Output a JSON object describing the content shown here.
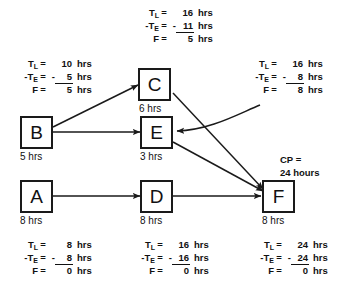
{
  "diagram": {
    "nodes": [
      {
        "id": "C",
        "label": "C",
        "duration": "6 hrs"
      },
      {
        "id": "B",
        "label": "B",
        "duration": "5 hrs"
      },
      {
        "id": "E",
        "label": "E",
        "duration": "3 hrs"
      },
      {
        "id": "A",
        "label": "A",
        "duration": "8 hrs"
      },
      {
        "id": "D",
        "label": "D",
        "duration": "8 hrs"
      },
      {
        "id": "F",
        "label": "F",
        "duration": "8 hrs"
      }
    ],
    "edges": [
      {
        "from": "B",
        "to": "C"
      },
      {
        "from": "B",
        "to": "E"
      },
      {
        "from": "C",
        "to": "F"
      },
      {
        "from": "E",
        "to": "F"
      },
      {
        "from": "A",
        "to": "D"
      },
      {
        "from": "D",
        "to": "F"
      }
    ],
    "calc_blocks": [
      {
        "id": "calc-c",
        "for_node": "C",
        "tl_label": "T",
        "tl_sub": "L",
        "tl_eq": "=",
        "tl_value": "16",
        "tl_unit": "hrs",
        "te_label": "-T",
        "te_sub": "E",
        "te_eq": "=",
        "te_sign": "-",
        "te_value": "11",
        "te_unit": "hrs",
        "f_label": "F",
        "f_eq": "=",
        "f_value": "5",
        "f_unit": "hrs"
      },
      {
        "id": "calc-b",
        "for_node": "B",
        "tl_label": "T",
        "tl_sub": "L",
        "tl_eq": "=",
        "tl_value": "10",
        "tl_unit": "hrs",
        "te_label": "-T",
        "te_sub": "E",
        "te_eq": "=",
        "te_sign": "-",
        "te_value": "5",
        "te_unit": "hrs",
        "f_label": "F",
        "f_eq": "=",
        "f_value": "5",
        "f_unit": "hrs"
      },
      {
        "id": "calc-e",
        "for_node": "E",
        "tl_label": "T",
        "tl_sub": "L",
        "tl_eq": "=",
        "tl_value": "16",
        "tl_unit": "hrs",
        "te_label": "-T",
        "te_sub": "E",
        "te_eq": "=",
        "te_sign": "-",
        "te_value": "8",
        "te_unit": "hrs",
        "f_label": "F",
        "f_eq": "=",
        "f_value": "8",
        "f_unit": "hrs"
      },
      {
        "id": "calc-a",
        "for_node": "A",
        "tl_label": "T",
        "tl_sub": "L",
        "tl_eq": "=",
        "tl_value": "8",
        "tl_unit": "hrs",
        "te_label": "-T",
        "te_sub": "E",
        "te_eq": "=",
        "te_sign": "-",
        "te_value": "8",
        "te_unit": "hrs",
        "f_label": "F",
        "f_eq": "=",
        "f_value": "0",
        "f_unit": "hrs"
      },
      {
        "id": "calc-d",
        "for_node": "D",
        "tl_label": "T",
        "tl_sub": "L",
        "tl_eq": "=",
        "tl_value": "16",
        "tl_unit": "hrs",
        "te_label": "-T",
        "te_sub": "E",
        "te_eq": "=",
        "te_sign": "-",
        "te_value": "16",
        "te_unit": "hrs",
        "f_label": "F",
        "f_eq": "=",
        "f_value": "0",
        "f_unit": "hrs"
      },
      {
        "id": "calc-f",
        "for_node": "F",
        "tl_label": "T",
        "tl_sub": "L",
        "tl_eq": "=",
        "tl_value": "24",
        "tl_unit": "hrs",
        "te_label": "-T",
        "te_sub": "E",
        "te_eq": "=",
        "te_sign": "-",
        "te_value": "24",
        "te_unit": "hrs",
        "f_label": "F",
        "f_eq": "=",
        "f_value": "0",
        "f_unit": "hrs"
      }
    ],
    "cp_note": {
      "line1": "CP  =",
      "line2": "24  hours"
    },
    "colors": {
      "stroke": "#1a1a1a",
      "text": "#111111",
      "background": "#ffffff"
    }
  }
}
